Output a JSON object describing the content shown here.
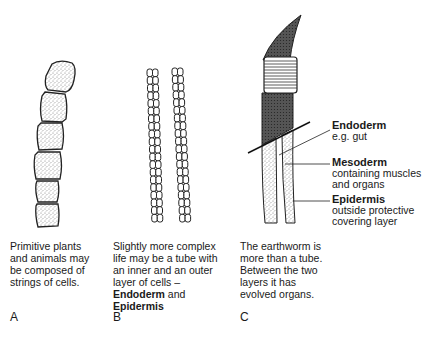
{
  "panels": [
    {
      "letter": "A",
      "caption": [
        "Primitive plants",
        "and animals may",
        "be composed of",
        "strings of cells."
      ]
    },
    {
      "letter": "B",
      "caption": [
        "Slightly more complex",
        "life may be a tube with",
        "an inner and an outer",
        "layer of cells –"
      ],
      "bold_line_1": "Endoderm",
      "and": " and",
      "bold_line_2": "Epidermis"
    },
    {
      "letter": "C",
      "caption": [
        "The earthworm is",
        "more than a tube.",
        "Between the two",
        "layers it has",
        "evolved organs."
      ]
    }
  ],
  "labels": {
    "endoderm": {
      "title": "Endoderm",
      "desc": [
        "e.g. gut"
      ]
    },
    "mesoderm": {
      "title": "Mesoderm",
      "desc": [
        "containing muscles",
        "and organs"
      ]
    },
    "epidermis": {
      "title": "Epidermis",
      "desc": [
        "outside protective",
        "covering layer"
      ]
    }
  }
}
